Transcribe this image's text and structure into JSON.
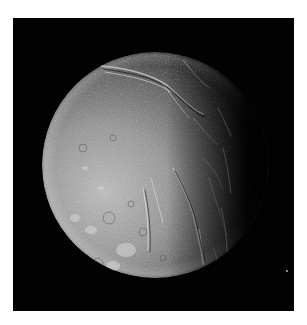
{
  "image": {
    "subject": "Ariel (moon of Uranus), partially illuminated, grayscale spacecraft photograph",
    "alt": "Grayscale photo of a cratered, fractured icy moon lit from the left against a black sky"
  },
  "colors": {
    "page_background": "#ffffff",
    "space": "#020202",
    "surface_light": "#c9c9c9",
    "surface_mid": "#8a8a8a",
    "surface_dark": "#3a3a3a"
  }
}
